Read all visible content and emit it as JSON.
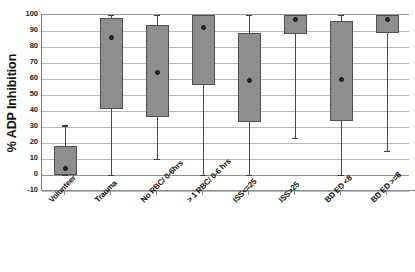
{
  "chart_data": {
    "type": "box",
    "title": "",
    "xlabel": "",
    "ylabel": "% ADP Inhibition",
    "ylim": [
      -10,
      100
    ],
    "ytick_step": 10,
    "grid": true,
    "legend": "none",
    "ytick_labels": [
      "100",
      "90",
      "80",
      "70",
      "60",
      "50",
      "40",
      "30",
      "20",
      "10",
      "0",
      "-10"
    ],
    "categories": [
      "Volunteer",
      "Trauma",
      "No RBC/ 0-6hrs",
      "> 1 RBC/ 0-6 hrs",
      "ISS<=25",
      "ISS>25",
      "BD ED <8",
      "BD ED >=8"
    ],
    "boxes": [
      {
        "category": "Volunteer",
        "whisker_low": 0,
        "q1": 0,
        "median": 4,
        "q3": 18,
        "whisker_high": 31
      },
      {
        "category": "Trauma",
        "whisker_low": 0,
        "q1": 41,
        "median": 86,
        "q3": 98,
        "whisker_high": 100
      },
      {
        "category": "No RBC/ 0-6hrs",
        "whisker_low": 10,
        "q1": 36,
        "median": 64,
        "q3": 94,
        "whisker_high": 100
      },
      {
        "category": "> 1 RBC/ 0-6 hrs",
        "whisker_low": 0,
        "q1": 56,
        "median": 92,
        "q3": 100,
        "whisker_high": 100
      },
      {
        "category": "ISS<=25",
        "whisker_low": 0,
        "q1": 33,
        "median": 59,
        "q3": 89,
        "whisker_high": 100
      },
      {
        "category": "ISS>25",
        "whisker_low": 23,
        "q1": 88,
        "median": 97,
        "q3": 100,
        "whisker_high": 100
      },
      {
        "category": "BD ED <8",
        "whisker_low": 0,
        "q1": 34,
        "median": 60,
        "q3": 96,
        "whisker_high": 100
      },
      {
        "category": "BD ED >=8",
        "whisker_low": 15,
        "q1": 89,
        "median": 97,
        "q3": 100,
        "whisker_high": 100
      }
    ],
    "colors": {
      "box_fill": "#8e8e8e",
      "box_border": "#4f4f4f",
      "whisker": "#4a4a4a",
      "median_dot": "#2b2b2b",
      "gridline": "#b9b9b9",
      "axis": "#8a8a8a",
      "background": "#ffffff",
      "text": "#0d0d0d"
    }
  }
}
